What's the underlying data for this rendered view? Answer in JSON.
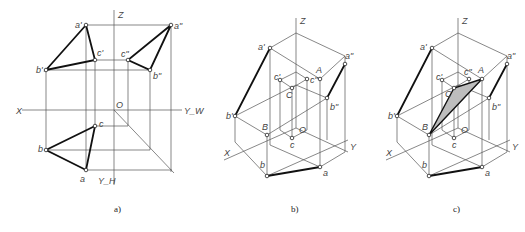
{
  "figure": {
    "panels": [
      {
        "id": "a",
        "caption": "a)",
        "axis_labels": {
          "x": "X",
          "z": "Z",
          "o": "O",
          "yw": "Y_W",
          "yh": "Y_H"
        },
        "point_labels": {
          "a1": "a'",
          "b1": "b'",
          "c1": "c'",
          "a2": "a\"",
          "b2": "b\"",
          "c2": "c\"",
          "a": "a",
          "b": "b",
          "c": "c"
        }
      },
      {
        "id": "b",
        "caption": "b)",
        "axis_labels": {
          "x": "X",
          "y": "Y",
          "z": "Z",
          "o": "O"
        },
        "point_labels": {
          "a1": "a'",
          "b1": "b'",
          "c1": "c'",
          "a2": "a\"",
          "b2": "b\"",
          "c2": "c\"",
          "a": "a",
          "b": "b",
          "c": "c",
          "A": "A",
          "B": "B",
          "C": "C"
        }
      },
      {
        "id": "c",
        "caption": "c)",
        "axis_labels": {
          "x": "X",
          "y": "Y",
          "z": "Z",
          "o": "O"
        },
        "point_labels": {
          "a1": "a'",
          "b1": "b'",
          "c1": "c'",
          "a2": "a\"",
          "b2": "b\"",
          "c2": "c\"",
          "a": "a",
          "b": "b",
          "c": "c",
          "A": "A",
          "B": "B",
          "C": "C"
        }
      }
    ]
  }
}
